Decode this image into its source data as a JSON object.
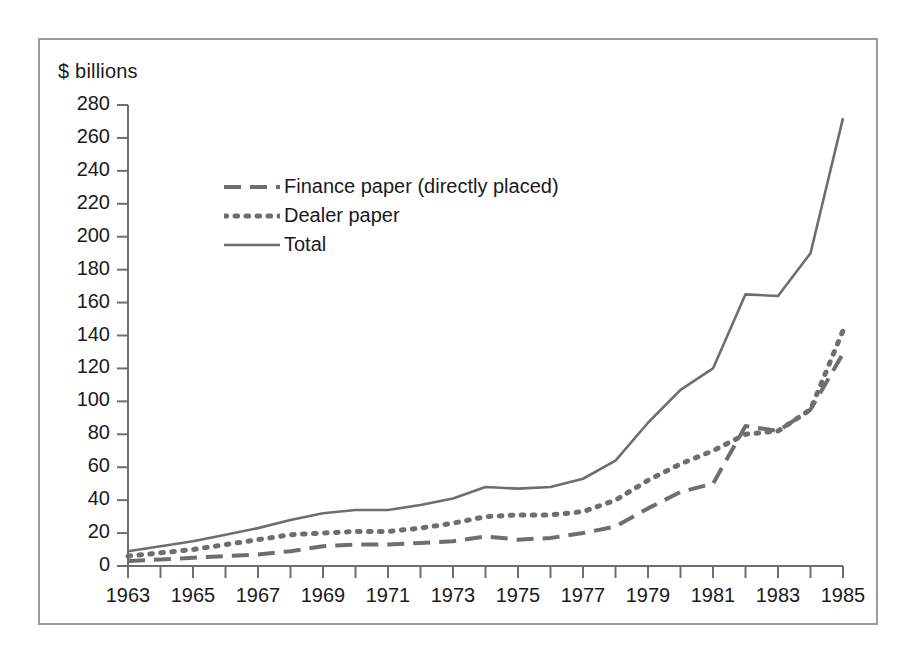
{
  "chart_data": {
    "type": "line",
    "title": "",
    "subtitle": "",
    "xlabel": "",
    "ylabel": "$ billions",
    "unit_label": "$ billions",
    "xlim": [
      1963,
      1985
    ],
    "ylim": [
      0,
      280
    ],
    "ytick_step": 20,
    "xtick_step": 1,
    "xlabel_step": 2,
    "grid": false,
    "legend_position": "upper-left-inside",
    "x": [
      1963,
      1964,
      1965,
      1966,
      1967,
      1968,
      1969,
      1970,
      1971,
      1972,
      1973,
      1974,
      1975,
      1976,
      1977,
      1978,
      1979,
      1980,
      1981,
      1982,
      1983,
      1984,
      1985
    ],
    "ytick_labels": [
      "0",
      "20",
      "40",
      "60",
      "80",
      "100",
      "120",
      "140",
      "160",
      "180",
      "200",
      "220",
      "240",
      "260",
      "280"
    ],
    "ytick_values": [
      0,
      20,
      40,
      60,
      80,
      100,
      120,
      140,
      160,
      180,
      200,
      220,
      240,
      260,
      280
    ],
    "xtick_labels": [
      "1963",
      "1965",
      "1967",
      "1969",
      "1971",
      "1973",
      "1975",
      "1977",
      "1979",
      "1981",
      "1983",
      "1985"
    ],
    "xtick_values": [
      1963,
      1965,
      1967,
      1969,
      1971,
      1973,
      1975,
      1977,
      1979,
      1981,
      1983,
      1985
    ],
    "series": [
      {
        "name": "Finance paper (directly placed)",
        "style": "dashed",
        "color": "#6e6e6e",
        "values": [
          3,
          4,
          5,
          6,
          7,
          9,
          12,
          13,
          13,
          14,
          15,
          18,
          16,
          17,
          20,
          24,
          35,
          45,
          50,
          85,
          82,
          95,
          129
        ]
      },
      {
        "name": "Dealer paper",
        "style": "dotted",
        "color": "#6e6e6e",
        "values": [
          6,
          8,
          10,
          13,
          16,
          19,
          20,
          21,
          21,
          23,
          26,
          30,
          31,
          31,
          33,
          40,
          52,
          62,
          70,
          80,
          82,
          95,
          143
        ]
      },
      {
        "name": "Total",
        "style": "solid",
        "color": "#6e6e6e",
        "values": [
          9,
          12,
          15,
          19,
          23,
          28,
          32,
          34,
          34,
          37,
          41,
          48,
          47,
          48,
          53,
          64,
          87,
          107,
          120,
          165,
          164,
          190,
          272
        ]
      }
    ]
  },
  "legend": {
    "items": [
      {
        "label": "Finance paper (directly placed)",
        "style": "dashed"
      },
      {
        "label": "Dealer paper",
        "style": "dotted"
      },
      {
        "label": "Total",
        "style": "solid"
      }
    ]
  },
  "colors": {
    "line": "#6e6e6e",
    "axis": "#6e6e6e",
    "frame": "#9b9b9b",
    "text": "#1a1a1a",
    "background": "#ffffff"
  }
}
